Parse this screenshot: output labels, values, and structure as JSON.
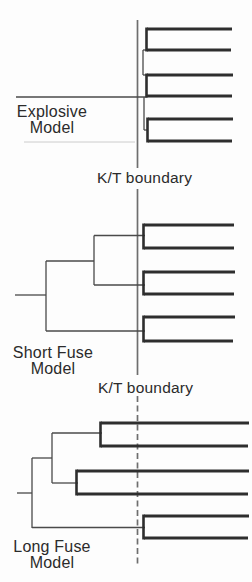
{
  "figure": {
    "colors": {
      "background": "#fdfdfd",
      "branch_thick": "#2e2e2e",
      "branch_thin": "#4a4a4a",
      "boundary": "#6e6e6e",
      "text": "#2b2b2b",
      "artifact": "#cccccc"
    },
    "labels": {
      "explosive": [
        "Explosive",
        "Model"
      ],
      "kt_upper": "K/T boundary",
      "short_fuse": [
        "Short Fuse",
        "Model"
      ],
      "kt_lower": "K/T boundary",
      "long_fuse": [
        "Long Fuse",
        "Model"
      ]
    },
    "boundary_segments": [
      {
        "x": 137.5,
        "y1": 20,
        "y2": 168,
        "dashed": false
      },
      {
        "x": 137.5,
        "y1": 189,
        "y2": 375,
        "dashed": false
      },
      {
        "x": 137.5,
        "y1": 396,
        "y2": 564,
        "dashed": true
      }
    ],
    "models": [
      {
        "name": "Explosive Model",
        "segments": {
          "thin": [
            [
              16,
              97,
              147,
              97
            ],
            [
              143,
              50,
              146,
              50
            ],
            [
              143,
              50,
              143,
              75
            ],
            [
              143,
              75,
              147,
              75
            ],
            [
              144,
              97,
              144,
              130
            ],
            [
              144,
              130,
              147.5,
              130
            ]
          ],
          "bracket": [
            [
              146.5,
              27.5,
              146.5,
              51.5
            ],
            [
              146.5,
              73.5,
              146.5,
              97.5
            ],
            [
              147.5,
              117.5,
              147.5,
              142.5
            ]
          ],
          "thick": [
            [
              147,
              29,
              232,
              29
            ],
            [
              147,
              50,
              231,
              50
            ],
            [
              147,
              75,
              233,
              75
            ],
            [
              147,
              96,
              232,
              96
            ],
            [
              148,
              119,
              233,
              119
            ],
            [
              148,
              141,
              232,
              141
            ]
          ],
          "faint": [
            [
              24,
              142,
              135,
              142
            ]
          ]
        }
      },
      {
        "name": "Short Fuse Model",
        "segments": {
          "thin": [
            [
              15,
              295,
              46,
              295
            ],
            [
              46,
              261,
              46,
              331
            ],
            [
              46,
              261,
              94,
              261
            ],
            [
              94,
              235.5,
              94,
              285
            ],
            [
              94,
              235.5,
              145,
              235.5
            ],
            [
              94,
              285,
              145,
              285
            ],
            [
              46,
              331,
              145,
              331
            ]
          ],
          "bracket": [
            [
              143.5,
              223.5,
              143.5,
              249.5
            ],
            [
              143.5,
              270.5,
              143.5,
              295.5
            ],
            [
              143.5,
              315.5,
              143.5,
              342.5
            ]
          ],
          "thick": [
            [
              144,
              225,
              234,
              225
            ],
            [
              144,
              248,
              234,
              248
            ],
            [
              144,
              272,
              235,
              272
            ],
            [
              144,
              294,
              234,
              294
            ],
            [
              144,
              317,
              235,
              317
            ],
            [
              144,
              341,
              233,
              341
            ]
          ],
          "faint": []
        }
      },
      {
        "name": "Long Fuse Model",
        "segments": {
          "thin": [
            [
              17,
              493,
              32,
              493
            ],
            [
              32,
              458,
              32,
              528
            ],
            [
              32,
              458,
              52,
              458
            ],
            [
              52,
              433,
              52,
              483
            ],
            [
              52,
              433,
              102,
              433
            ],
            [
              52,
              483,
              78,
              483
            ],
            [
              32,
              527.5,
              145,
              527.5
            ]
          ],
          "bracket": [
            [
              100.5,
              421.5,
              100.5,
              447.5
            ],
            [
              76.5,
              469.5,
              76.5,
              495.5
            ],
            [
              143.5,
              514.5,
              143.5,
              539.5
            ]
          ],
          "thick": [
            [
              101,
              423,
              249,
              423
            ],
            [
              101,
              446,
              248,
              446
            ],
            [
              77,
              471,
              249,
              471
            ],
            [
              77,
              494,
              248,
              494
            ],
            [
              144,
              516,
              249,
              516
            ],
            [
              144,
              538,
              248,
              538
            ]
          ],
          "faint": []
        }
      }
    ]
  }
}
